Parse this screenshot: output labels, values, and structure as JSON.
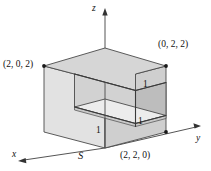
{
  "figure": {
    "background_color": "#ffffff",
    "stroke_color": "#4a4a4a",
    "colors": {
      "top_face": "#d6d6d6",
      "left_face": "#e2e2e2",
      "right_face": "#cfcfcf",
      "notch_back_wall": "#d2d2d2",
      "notch_left_wall": "#bdbdbd",
      "notch_floor": "#ececec",
      "axis": "#555555",
      "text": "#111111"
    }
  },
  "axes": [
    {
      "name": "x",
      "label": "x"
    },
    {
      "name": "y",
      "label": "y"
    },
    {
      "name": "z",
      "label": "z"
    }
  ],
  "vertex_labels": [
    {
      "name": "vertex-2-0-2",
      "label": "(2, 0, 2)"
    },
    {
      "name": "vertex-0-2-2",
      "label": "(0, 2, 2)"
    },
    {
      "name": "vertex-2-2-0",
      "label": "(2, 2, 0)"
    }
  ],
  "dimension_labels": [
    {
      "name": "dim-notch-front-bottom",
      "label": "1"
    },
    {
      "name": "dim-notch-right-bottom",
      "label": "1"
    },
    {
      "name": "dim-notch-right-vertical",
      "label": "1"
    }
  ],
  "surface_label": {
    "name": "surface-S",
    "label": "S"
  }
}
